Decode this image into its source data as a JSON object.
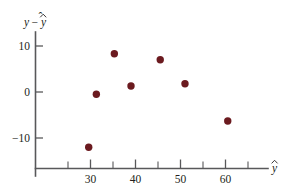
{
  "chart_data": {
    "type": "scatter",
    "title": "",
    "subtitle": "",
    "xlabel": "y-hat",
    "ylabel": "y - y-hat",
    "xlabel_display": "ŷ",
    "ylabel_display": "y − ŷ",
    "xlim": [
      22,
      67
    ],
    "ylim": [
      -16,
      13
    ],
    "grid": false,
    "legend": null,
    "x_ticks_major": [
      30,
      40,
      50,
      60
    ],
    "x_ticks_major_labels": [
      "30",
      "40",
      "50",
      "60"
    ],
    "x_ticks_minor": [
      25,
      35,
      45,
      55,
      65
    ],
    "y_ticks_major": [
      10,
      0,
      -10
    ],
    "y_ticks_major_labels": [
      "10",
      "0",
      "−10"
    ],
    "point_color": "#6b1a1f",
    "axis_color": "#58585a",
    "background_color": "#ffffff",
    "x": [
      29.6,
      31.3,
      35.3,
      39.0,
      45.5,
      51.0,
      60.5
    ],
    "y": [
      -12.0,
      -0.5,
      8.3,
      1.3,
      7.0,
      1.8,
      -6.3
    ],
    "points": [
      {
        "x": 29.6,
        "y": -12.0
      },
      {
        "x": 31.3,
        "y": -0.5
      },
      {
        "x": 35.3,
        "y": 8.3
      },
      {
        "x": 39.0,
        "y": 1.3
      },
      {
        "x": 45.5,
        "y": 7.0
      },
      {
        "x": 51.0,
        "y": 1.8
      },
      {
        "x": 60.5,
        "y": -6.3
      }
    ],
    "n_points": 7
  },
  "axis_labels": {
    "y_axis_var": "y",
    "y_axis_minus": "−",
    "y_axis_fitted": "y",
    "x_axis_fitted": "y"
  }
}
